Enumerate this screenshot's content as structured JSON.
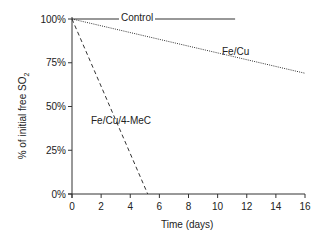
{
  "chart_data": {
    "type": "line",
    "title": "",
    "xlabel": "Time (days)",
    "ylabel": "% of initial free SO2",
    "xlim": [
      0,
      16
    ],
    "ylim": [
      0,
      100
    ],
    "x_ticks": [
      0,
      2,
      4,
      6,
      8,
      10,
      12,
      14,
      16
    ],
    "y_ticks": [
      "0%",
      "25%",
      "50%",
      "75%",
      "100%"
    ],
    "grid": false,
    "legend": "inline labels",
    "series": [
      {
        "name": "Control",
        "style": "solid",
        "x": [
          0,
          11.2
        ],
        "y": [
          100,
          100
        ]
      },
      {
        "name": "Fe/Cu",
        "style": "dotted",
        "x": [
          0,
          16
        ],
        "y": [
          100,
          69
        ]
      },
      {
        "name": "Fe/Cu/4-MeC",
        "style": "dashed",
        "x": [
          0,
          5.2
        ],
        "y": [
          100,
          0
        ]
      }
    ]
  },
  "labels": {
    "control": "Control",
    "fecu": "Fe/Cu",
    "fecu4mec": "Fe/Cu/4-MeC",
    "xlabel": "Time (days)",
    "ylabel_main": "% of initial free SO",
    "ylabel_sub": "2"
  }
}
